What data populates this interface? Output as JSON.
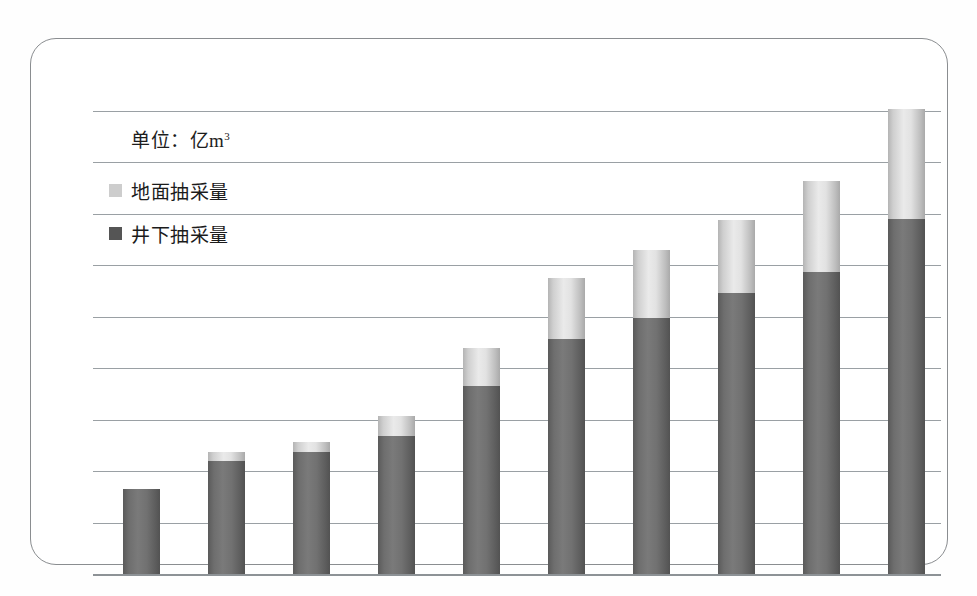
{
  "chart_data": {
    "type": "bar",
    "subtype": "stacked",
    "title": "",
    "unit_caption": "单位：亿m",
    "unit_exponent": "3",
    "xlabel": "",
    "ylabel": "",
    "grid": true,
    "gridlines": 10,
    "ylim": [
      0,
      9.0
    ],
    "axis_tick_values": [
      0,
      1,
      2,
      3,
      4,
      5,
      6,
      7,
      8,
      9
    ],
    "tick_labels_visible": false,
    "category_labels_visible": false,
    "categories": [
      "1",
      "2",
      "3",
      "4",
      "5",
      "6",
      "7",
      "8",
      "9",
      "10"
    ],
    "series": [
      {
        "name": "井下抽采量",
        "color": "#6e6e6e",
        "values": [
          1.65,
          2.2,
          2.37,
          2.68,
          3.65,
          4.57,
          4.97,
          5.46,
          5.87,
          6.9
        ]
      },
      {
        "name": "地面抽采量",
        "color": "#dcdcdc",
        "values": [
          0.0,
          0.17,
          0.19,
          0.4,
          0.75,
          1.18,
          1.32,
          1.42,
          1.77,
          2.14
        ]
      }
    ],
    "totals": [
      1.65,
      2.37,
      2.56,
      3.08,
      4.4,
      5.75,
      6.29,
      6.88,
      7.64,
      9.04
    ],
    "legend": {
      "position": "top-left",
      "entries": [
        {
          "label": "地面抽采量",
          "swatch": "light-gray"
        },
        {
          "label": "井下抽采量",
          "swatch": "dark-gray"
        }
      ]
    }
  },
  "colors": {
    "bar_dark": "#6e6e6e",
    "bar_light": "#dcdcdc",
    "gridline": "#9aa0a4",
    "card_border": "#8a8d90",
    "text": "#1b1b1b",
    "background": "#ffffff"
  }
}
